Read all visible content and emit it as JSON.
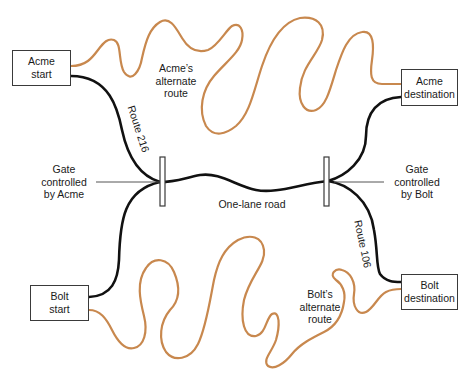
{
  "colors": {
    "main_route": "#111111",
    "alternate_route": "#c8884e",
    "gate": "#3a3a3a",
    "pointer": "#555555",
    "box_border": "#3a3a3a"
  },
  "nodes": {
    "acme_start": {
      "line1": "Acme",
      "line2": "start"
    },
    "acme_destination": {
      "line1": "Acme",
      "line2": "destination"
    },
    "bolt_start": {
      "line1": "Bolt",
      "line2": "start"
    },
    "bolt_destination": {
      "line1": "Bolt",
      "line2": "destination"
    }
  },
  "labels": {
    "acme_alternate": {
      "line1": "Acme’s",
      "line2": "alternate",
      "line3": "route"
    },
    "bolt_alternate": {
      "line1": "Bolt’s",
      "line2": "alternate",
      "line3": "route"
    },
    "gate_acme": {
      "line1": "Gate",
      "line2": "controlled",
      "line3": "by Acme"
    },
    "gate_bolt": {
      "line1": "Gate",
      "line2": "controlled",
      "line3": "by Bolt"
    },
    "one_lane_road": "One-lane road",
    "route_216": "Route 216",
    "route_106": "Route 106"
  }
}
